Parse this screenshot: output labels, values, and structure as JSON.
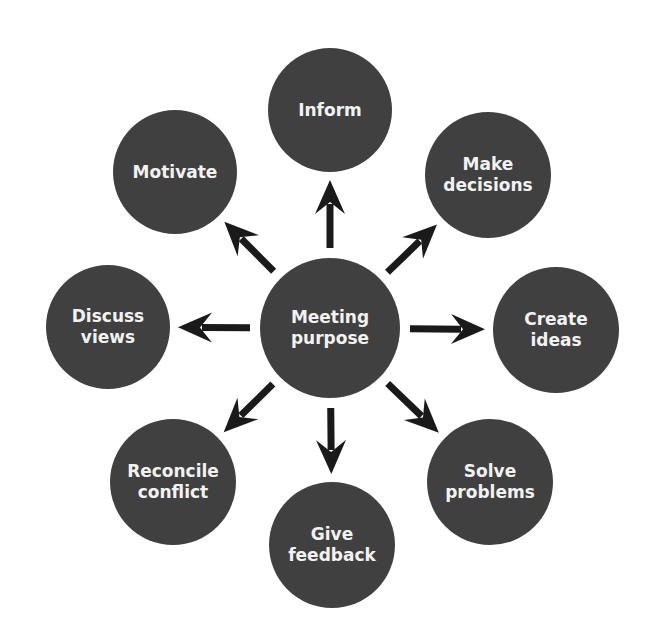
{
  "diagram": {
    "type": "hub-and-spoke",
    "colors": {
      "node_fill": "#404040",
      "node_text": "#f2f2f2",
      "arrow": "#1a1a1a",
      "background": "#ffffff"
    },
    "center": {
      "label": "Meeting\npurpose",
      "cx": 330,
      "cy": 328,
      "r": 70
    },
    "nodes": [
      {
        "id": "inform",
        "label": "Inform",
        "cx": 330,
        "cy": 110,
        "r": 62
      },
      {
        "id": "make-decisions",
        "label": "Make\ndecisions",
        "cx": 488,
        "cy": 175,
        "r": 63
      },
      {
        "id": "create-ideas",
        "label": "Create\nideas",
        "cx": 556,
        "cy": 330,
        "r": 63
      },
      {
        "id": "solve-problems",
        "label": "Solve\nproblems",
        "cx": 490,
        "cy": 482,
        "r": 63
      },
      {
        "id": "give-feedback",
        "label": "Give\nfeedback",
        "cx": 332,
        "cy": 545,
        "r": 63
      },
      {
        "id": "reconcile-conflict",
        "label": "Reconcile\nconflict",
        "cx": 173,
        "cy": 482,
        "r": 63
      },
      {
        "id": "discuss-views",
        "label": "Discuss\nviews",
        "cx": 108,
        "cy": 327,
        "r": 62
      },
      {
        "id": "motivate",
        "label": "Motivate",
        "cx": 175,
        "cy": 172,
        "r": 62
      }
    ]
  }
}
